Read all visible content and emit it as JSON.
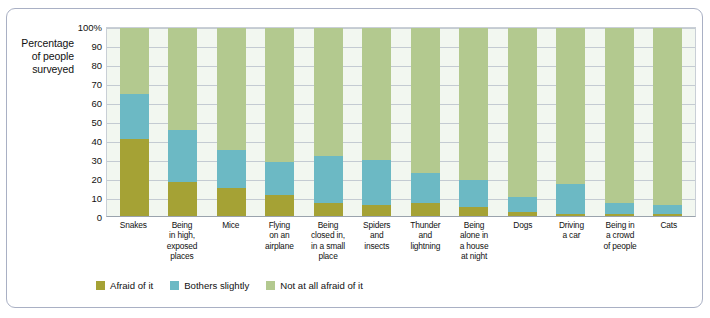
{
  "axis": {
    "y_caption": "Percentage of people surveyed",
    "y_caption_lines": [
      "Percentage",
      "of people",
      "surveyed"
    ],
    "ticks": [
      "100%",
      "90",
      "80",
      "70",
      "60",
      "50",
      "40",
      "30",
      "20",
      "10",
      "0"
    ]
  },
  "legend": {
    "items": [
      {
        "label": "Afraid of it",
        "color": "#a5a235",
        "key": "afraid"
      },
      {
        "label": "Bothers slightly",
        "color": "#6cb9c4",
        "key": "some"
      },
      {
        "label": "Not at all afraid of it",
        "color": "#b3c98f",
        "key": "none"
      }
    ]
  },
  "chart_data": {
    "type": "bar",
    "subtype": "stacked-percentage",
    "title": "",
    "xlabel": "",
    "ylabel": "Percentage of people surveyed",
    "ylim": [
      0,
      100
    ],
    "yticks": [
      0,
      10,
      20,
      30,
      40,
      50,
      60,
      70,
      80,
      90,
      100
    ],
    "grid": true,
    "legend_position": "bottom",
    "categories": [
      "Snakes",
      "Being in high, exposed places",
      "Mice",
      "Flying on an airplane",
      "Being closed in, in a small place",
      "Spiders and insects",
      "Thunder and lightning",
      "Being alone in a house at night",
      "Dogs",
      "Driving a car",
      "Being in a crowd of people",
      "Cats"
    ],
    "category_lines": [
      [
        "Snakes"
      ],
      [
        "Being",
        "in high,",
        "exposed",
        "places"
      ],
      [
        "Mice"
      ],
      [
        "Flying",
        "on an",
        "airplane"
      ],
      [
        "Being",
        "closed in,",
        "in a small",
        "place"
      ],
      [
        "Spiders",
        "and",
        "insects"
      ],
      [
        "Thunder",
        "and",
        "lightning"
      ],
      [
        "Being",
        "alone in",
        "a house",
        "at night"
      ],
      [
        "Dogs"
      ],
      [
        "Driving",
        "a car"
      ],
      [
        "Being in",
        "a crowd",
        "of people"
      ],
      [
        "Cats"
      ]
    ],
    "series": [
      {
        "name": "Afraid of it",
        "color": "#a5a235",
        "values": [
          41,
          18,
          15,
          11,
          7,
          6,
          7,
          5,
          2,
          1,
          1,
          1
        ]
      },
      {
        "name": "Bothers slightly",
        "color": "#6cb9c4",
        "values": [
          24,
          28,
          20,
          18,
          25,
          24,
          16,
          14,
          8,
          16,
          6,
          5
        ]
      },
      {
        "name": "Not at all afraid of it",
        "color": "#b3c98f",
        "values": [
          35,
          54,
          65,
          71,
          68,
          70,
          77,
          81,
          90,
          83,
          93,
          94
        ]
      }
    ]
  }
}
